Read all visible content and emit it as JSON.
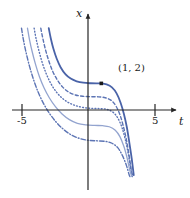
{
  "figure": {
    "kind": "solution-curve-family",
    "background": "#ffffff"
  },
  "axes": {
    "x_axis": {
      "name": "t",
      "label": "t",
      "tick_labels": [
        "-5",
        "5"
      ],
      "tick_values": [
        -5,
        5
      ],
      "range": [
        -6.6,
        7.0
      ],
      "arrow": "right"
    },
    "y_axis": {
      "name": "x",
      "label": "x",
      "range": [
        -5.0,
        6.2
      ],
      "arrow": "up"
    },
    "origin_px": [
      88,
      110
    ],
    "color": "#262626"
  },
  "annotations": [
    {
      "name": "point-1-2",
      "text": "(1, 2)",
      "marker": "filled-square-dot",
      "t": 1,
      "x": 2,
      "marker_color": "#1a1a1a"
    }
  ],
  "colors": {
    "curve_primary": "#4a63a8",
    "curve_secondary": "#5c74b4",
    "curve_light": "#93a4cf",
    "axis": "#262626",
    "text": "#1a1a1a"
  },
  "chart_data": {
    "type": "line",
    "title": "",
    "xlabel": "t",
    "ylabel": "x",
    "xlim": [
      -6.6,
      7.0
    ],
    "ylim": [
      -5.0,
      6.2
    ],
    "grid": false,
    "legend": "none",
    "xticks": [
      -5,
      5
    ],
    "xticklabels": [
      "-5",
      "5"
    ],
    "yticks": [],
    "yticklabels": [],
    "annotations": [
      {
        "text": "(1, 2)",
        "x": 1,
        "y": 2,
        "marker": true
      }
    ],
    "series": [
      {
        "name": "curve-1-solid-primary",
        "linestyle": "solid",
        "color": "#4a63a8",
        "width": 1.8,
        "plateau_level": 2.0,
        "points": [
          [
            -2.95,
            6.15
          ],
          [
            -2.8,
            5.4
          ],
          [
            -2.6,
            4.6
          ],
          [
            -2.35,
            3.85
          ],
          [
            -2.05,
            3.2
          ],
          [
            -1.7,
            2.7
          ],
          [
            -1.3,
            2.36
          ],
          [
            -0.85,
            2.16
          ],
          [
            -0.35,
            2.05
          ],
          [
            0.2,
            2.01
          ],
          [
            0.7,
            2.0
          ],
          [
            1.0,
            2.0
          ],
          [
            1.4,
            1.92
          ],
          [
            1.8,
            1.7
          ],
          [
            2.15,
            1.25
          ],
          [
            2.45,
            0.55
          ],
          [
            2.7,
            -0.3
          ],
          [
            2.92,
            -1.3
          ],
          [
            3.1,
            -2.4
          ],
          [
            3.28,
            -3.6
          ],
          [
            3.44,
            -4.9
          ]
        ]
      },
      {
        "name": "curve-2-dashed",
        "linestyle": "dashed",
        "color": "#5c74b4",
        "width": 1.4,
        "plateau_level": 1.0,
        "points": [
          [
            -3.55,
            6.15
          ],
          [
            -3.4,
            5.4
          ],
          [
            -3.2,
            4.55
          ],
          [
            -2.95,
            3.7
          ],
          [
            -2.65,
            2.9
          ],
          [
            -2.3,
            2.25
          ],
          [
            -1.9,
            1.72
          ],
          [
            -1.45,
            1.35
          ],
          [
            -0.95,
            1.13
          ],
          [
            -0.4,
            1.03
          ],
          [
            0.2,
            1.0
          ],
          [
            0.8,
            0.99
          ],
          [
            1.3,
            0.92
          ],
          [
            1.75,
            0.72
          ],
          [
            2.1,
            0.3
          ],
          [
            2.4,
            -0.35
          ],
          [
            2.65,
            -1.2
          ],
          [
            2.88,
            -2.2
          ],
          [
            3.08,
            -3.35
          ],
          [
            3.26,
            -4.55
          ],
          [
            3.38,
            -5.0
          ]
        ]
      },
      {
        "name": "curve-3-dotted",
        "linestyle": "dotted",
        "color": "#5c74b4",
        "width": 1.4,
        "plateau_level": 0.1,
        "points": [
          [
            -4.05,
            6.15
          ],
          [
            -3.9,
            5.35
          ],
          [
            -3.7,
            4.5
          ],
          [
            -3.45,
            3.6
          ],
          [
            -3.15,
            2.75
          ],
          [
            -2.8,
            2.0
          ],
          [
            -2.4,
            1.38
          ],
          [
            -1.95,
            0.9
          ],
          [
            -1.45,
            0.55
          ],
          [
            -0.9,
            0.32
          ],
          [
            -0.3,
            0.18
          ],
          [
            0.35,
            0.12
          ],
          [
            0.95,
            0.1
          ],
          [
            1.45,
            0.04
          ],
          [
            1.9,
            -0.18
          ],
          [
            2.25,
            -0.62
          ],
          [
            2.55,
            -1.3
          ],
          [
            2.8,
            -2.2
          ],
          [
            3.02,
            -3.25
          ],
          [
            3.2,
            -4.35
          ],
          [
            3.34,
            -5.0
          ]
        ]
      },
      {
        "name": "curve-4-solid-light",
        "linestyle": "solid",
        "color": "#93a4cf",
        "width": 1.3,
        "plateau_level": -1.15,
        "points": [
          [
            -4.55,
            6.15
          ],
          [
            -4.4,
            5.3
          ],
          [
            -4.2,
            4.4
          ],
          [
            -3.95,
            3.45
          ],
          [
            -3.65,
            2.5
          ],
          [
            -3.3,
            1.65
          ],
          [
            -2.9,
            0.9
          ],
          [
            -2.45,
            0.25
          ],
          [
            -1.95,
            -0.3
          ],
          [
            -1.4,
            -0.72
          ],
          [
            -0.8,
            -1.0
          ],
          [
            -0.15,
            -1.12
          ],
          [
            0.5,
            -1.16
          ],
          [
            1.1,
            -1.18
          ],
          [
            1.6,
            -1.26
          ],
          [
            2.05,
            -1.52
          ],
          [
            2.4,
            -2.0
          ],
          [
            2.7,
            -2.75
          ],
          [
            2.95,
            -3.65
          ],
          [
            3.16,
            -4.6
          ],
          [
            3.3,
            -5.0
          ]
        ]
      },
      {
        "name": "curve-5-dashdot",
        "linestyle": "dashdot",
        "color": "#5c74b4",
        "width": 1.4,
        "plateau_level": -2.3,
        "points": [
          [
            -5.0,
            6.15
          ],
          [
            -4.85,
            5.25
          ],
          [
            -4.65,
            4.3
          ],
          [
            -4.4,
            3.3
          ],
          [
            -4.1,
            2.3
          ],
          [
            -3.75,
            1.35
          ],
          [
            -3.35,
            0.5
          ],
          [
            -2.9,
            -0.25
          ],
          [
            -2.4,
            -0.9
          ],
          [
            -1.85,
            -1.45
          ],
          [
            -1.25,
            -1.88
          ],
          [
            -0.6,
            -2.15
          ],
          [
            0.05,
            -2.28
          ],
          [
            0.7,
            -2.32
          ],
          [
            1.3,
            -2.36
          ],
          [
            1.8,
            -2.5
          ],
          [
            2.25,
            -2.85
          ],
          [
            2.6,
            -3.45
          ],
          [
            2.9,
            -4.2
          ],
          [
            3.12,
            -4.95
          ],
          [
            3.22,
            -5.0
          ]
        ]
      }
    ]
  }
}
